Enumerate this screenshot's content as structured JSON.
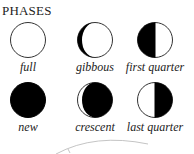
{
  "title": "PHASES",
  "phases": [
    {
      "label": "full",
      "type": "full"
    },
    {
      "label": "gibbous",
      "type": "gibbous"
    },
    {
      "label": "first quarter",
      "type": "first-quarter"
    },
    {
      "label": "new",
      "type": "new"
    },
    {
      "label": "crescent",
      "type": "crescent"
    },
    {
      "label": "last quarter",
      "type": "last-quarter"
    }
  ],
  "colors": {
    "dark": "#000000",
    "light": "#ffffff",
    "outline": "#333333",
    "curve": "#aaaaaa"
  }
}
